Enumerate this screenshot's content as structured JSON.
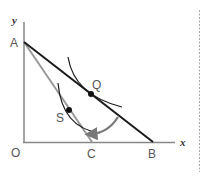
{
  "diagram": {
    "type": "budget-constraint-indifference",
    "axes": {
      "x_label": "x",
      "y_label": "y",
      "origin_label": "O"
    },
    "points": {
      "A": "A",
      "B": "B",
      "C": "C",
      "Q": "Q",
      "S": "S"
    },
    "lines": [
      {
        "name": "budget-line-AB",
        "from": "A",
        "to": "B",
        "color": "#1a1a1a"
      },
      {
        "name": "budget-line-AC",
        "from": "A",
        "to": "C",
        "color": "#999999"
      }
    ],
    "curves": [
      {
        "name": "indifference-curve-Q",
        "tangent_point": "Q",
        "color": "#1a1a1a"
      },
      {
        "name": "indifference-curve-S",
        "tangent_point": "S",
        "color": "#1a1a1a"
      }
    ],
    "arrow": {
      "direction": "from Q toward S",
      "color": "#777777"
    },
    "colors": {
      "axis": "#888888",
      "dark_line": "#1a1a1a",
      "gray_line": "#999999",
      "arrow": "#777777",
      "dashed_border": "#aaaaaa"
    }
  }
}
